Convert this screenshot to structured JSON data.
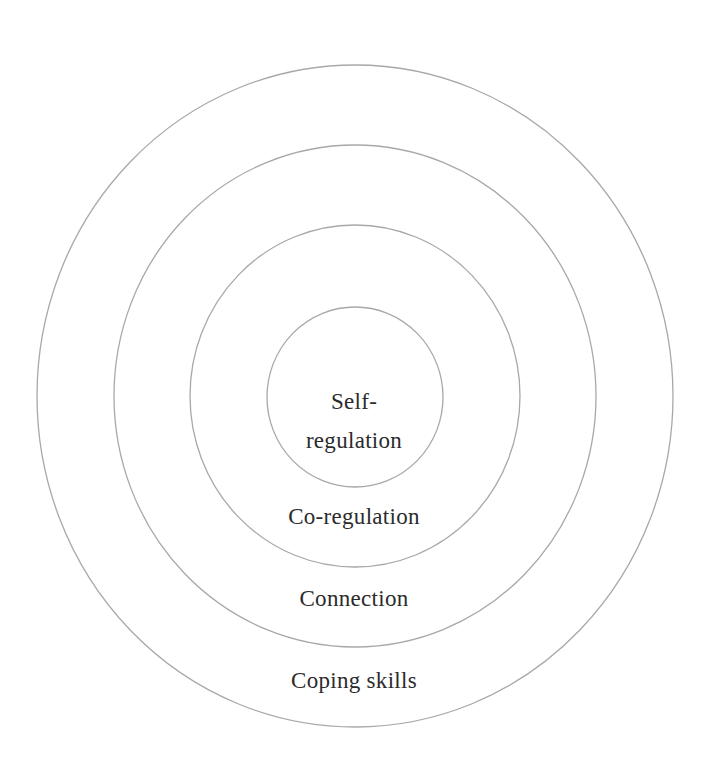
{
  "diagram": {
    "type": "concentric-circles",
    "colors": {
      "stroke": "#a8a8a8",
      "text": "#2b2b2b",
      "background": "#ffffff"
    },
    "layers": [
      {
        "order": 1,
        "position": "innermost",
        "label_line1": "Self-",
        "label_line2": "regulation",
        "label": "Self-regulation"
      },
      {
        "order": 2,
        "position": "second",
        "label": "Co-regulation"
      },
      {
        "order": 3,
        "position": "third",
        "label": "Connection"
      },
      {
        "order": 4,
        "position": "outermost",
        "label": "Coping skills"
      }
    ]
  }
}
